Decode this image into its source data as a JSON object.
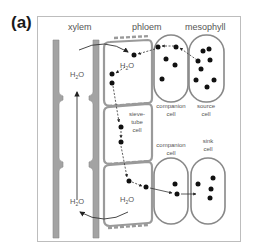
{
  "panel_label": "(a)",
  "headers": {
    "xylem": "xylem",
    "phloem": "phloem",
    "mesophyll": "mesophyll"
  },
  "labels": {
    "h2o_top_xylem": "H2O",
    "h2o_top_phloem": "H2O",
    "h2o_bottom_xylem": "H2O",
    "h2o_bottom_phloem": "H2O",
    "companion_cell_top_1": "companion",
    "companion_cell_top_2": "cell",
    "source_cell_1": "source",
    "source_cell_2": "cell",
    "sieve_tube_1": "sieve-",
    "sieve_tube_2": "tube",
    "sieve_tube_3": "cell",
    "companion_cell_bottom_1": "companion",
    "companion_cell_bottom_2": "cell",
    "sink_cell_1": "sink",
    "sink_cell_2": "cell"
  },
  "colors": {
    "wall": "#9a9a9a",
    "wall_dark": "#7a7a7a",
    "dot": "#111111",
    "arrow": "#333333",
    "frame": "#bdbdbd"
  }
}
